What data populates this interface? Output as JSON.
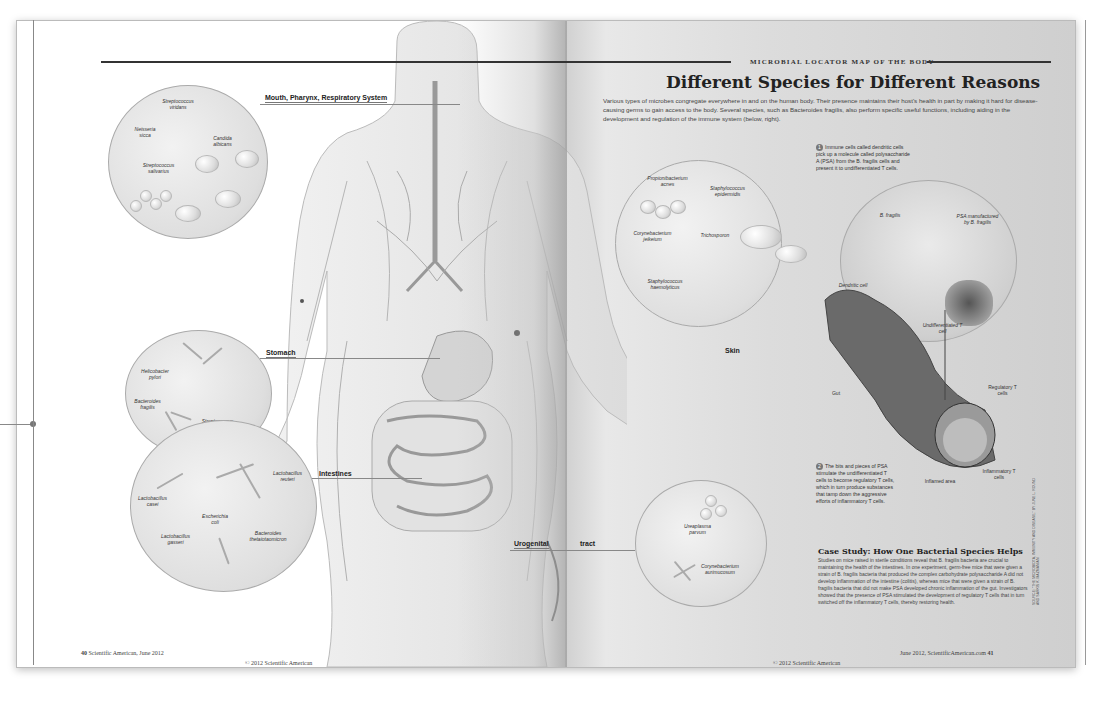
{
  "kicker": "Microbial Locator Map of the Body",
  "headline": "Different Species for Different Reasons",
  "intro": "Various types of microbes congregate everywhere in and on the human body. Their presence maintains their host's health in part by making it hard for disease-causing germs to gain access to the body. Several species, such as Bacteroides fragilis, also perform specific useful functions, including aiding in the development and regulation of the immune system (below, right).",
  "sections": {
    "mouth": {
      "title": "Mouth, Pharynx, Respiratory System",
      "species": [
        "Streptococcus viridans",
        "Neisseria sicca",
        "Candida albicans",
        "Streptococcus salivarius"
      ]
    },
    "stomach": {
      "title": "Stomach",
      "species": [
        "Helicobacter pylori",
        "Bacteroides fragilis",
        "Streptococcus thermophilus"
      ]
    },
    "intestines": {
      "title": "Intestines",
      "species": [
        "Lactobacillus reuteri",
        "Lactobacillus casei",
        "Escherichia coli",
        "Lactobacillus gasseri",
        "Bacteroides thetaiotaomicron"
      ]
    },
    "skin": {
      "title": "Skin",
      "species": [
        "Propionibacterium acnes",
        "Staphylococcus epidermidis",
        "Corynebacterium jeikeium",
        "Trichosporon",
        "Staphylococcus haemolyticus"
      ]
    },
    "urogenital": {
      "title_a": "Urogenital",
      "title_b": "tract",
      "species": [
        "Ureaplasma parvum",
        "Corynebacterium aurimucosum"
      ]
    }
  },
  "immune": {
    "step1_num": "1",
    "step1": "Immune cells called dendritic cells pick up a molecule called polysaccharide A (PSA) from the B. fragilis cells and present it to undifferentiated T cells.",
    "step2_num": "2",
    "step2": "The bits and pieces of PSA stimulate the undifferentiated T cells to become regulatory T cells, which in turn produce substances that tamp down the aggressive efforts of inflammatory T cells.",
    "labels": {
      "bfragilis": "B. fragilis",
      "psa": "PSA manufactured by B. fragilis",
      "dendritic": "Dendritic cell",
      "undiff": "Undifferentiated T cell",
      "gut": "Gut",
      "regulatory": "Regulatory T cells",
      "inflammatory": "Inflammatory T cells",
      "inflamed": "Inflamed area"
    }
  },
  "case_study": {
    "title": "Case Study: How One Bacterial Species Helps",
    "body": "Studies on mice raised in sterile conditions reveal that B. fragilis bacteria are crucial to maintaining the health of the intestines. In one experiment, germ-free mice that were given a strain of B. fragilis bacteria that produced the complex carbohydrate polysaccharide A did not develop inflammation of the intestine (colitis), whereas mice that were given a strain of B. fragilis bacteria that did not make PSA developed chronic inflammation of the gut. Investigators showed that the presence of PSA stimulated the development of regulatory T cells that in turn switched off the inflammatory T cells, thereby restoring health."
  },
  "credit": "SOURCE: \"THE MICROBIOTA, IMMUNITY AND DISEASE,\" BY JUNE L. ROUND AND SARKIS K. MAZMANIAN",
  "footer": {
    "left_folio_num": "40",
    "left_folio": "Scientific American, June 2012",
    "left_copyright": "© 2012 Scientific American",
    "right_folio": "June 2012, ScientificAmerican.com",
    "right_folio_num": "41",
    "right_copyright": "© 2012 Scientific American"
  }
}
